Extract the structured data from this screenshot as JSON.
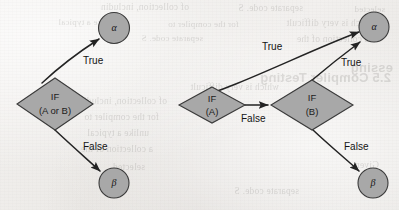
{
  "figure": {
    "caption": "",
    "background_color": "#efedea",
    "node_fill_color": "#a8a8a8",
    "node_stroke_color": "#3a3a3a",
    "edge_color": "#232323"
  },
  "showthrough_text": {
    "lines": [
      "selected",
      "separate code. S",
      "of collection, includin",
      "essing",
      "2.5 Compiler Testing",
      "which is very difficult",
      "for the compiler to",
      "unlike a typical",
      "Given",
      "a collection of the"
    ]
  },
  "diagram_left": {
    "name": "compound-condition",
    "nodes": [
      {
        "id": "alpha",
        "type": "circle",
        "label": "α",
        "cx": 114,
        "cy": 28,
        "r": 15.5
      },
      {
        "id": "if_a_or_b",
        "type": "diamond",
        "label_line1": "IF",
        "label_line2": "(A or B)",
        "cx": 55,
        "cy": 104,
        "rx": 38,
        "ry": 26
      },
      {
        "id": "beta",
        "type": "circle",
        "label": "β",
        "cx": 114,
        "cy": 183,
        "r": 15
      }
    ],
    "edges": [
      {
        "from": "if_a_or_b",
        "to": "alpha",
        "label": "True",
        "label_x": 83,
        "label_y": 61
      },
      {
        "from": "if_a_or_b",
        "to": "beta",
        "label": "False",
        "label_x": 83,
        "label_y": 147
      }
    ]
  },
  "diagram_right": {
    "name": "decomposed-condition",
    "nodes": [
      {
        "id": "alpha",
        "type": "circle",
        "label": "α",
        "cx": 374,
        "cy": 27,
        "r": 15
      },
      {
        "id": "if_a",
        "type": "diamond",
        "label_line1": "IF",
        "label_line2": "(A)",
        "cx": 212,
        "cy": 105,
        "rx": 33,
        "ry": 18
      },
      {
        "id": "if_b",
        "type": "diamond",
        "label_line1": "IF",
        "label_line2": "(B)",
        "cx": 312,
        "cy": 105,
        "rx": 41,
        "ry": 25
      },
      {
        "id": "beta",
        "type": "circle",
        "label": "β",
        "cx": 373,
        "cy": 183,
        "r": 15
      }
    ],
    "edges": [
      {
        "from": "if_a",
        "to": "alpha",
        "label": "True",
        "label_x": 262,
        "label_y": 47
      },
      {
        "from": "if_a",
        "to": "if_b",
        "label": "False",
        "label_x": 241,
        "label_y": 119
      },
      {
        "from": "if_b",
        "to": "alpha",
        "label": "True",
        "label_x": 341,
        "label_y": 63
      },
      {
        "from": "if_b",
        "to": "beta",
        "label": "False",
        "label_x": 344,
        "label_y": 147
      }
    ]
  }
}
